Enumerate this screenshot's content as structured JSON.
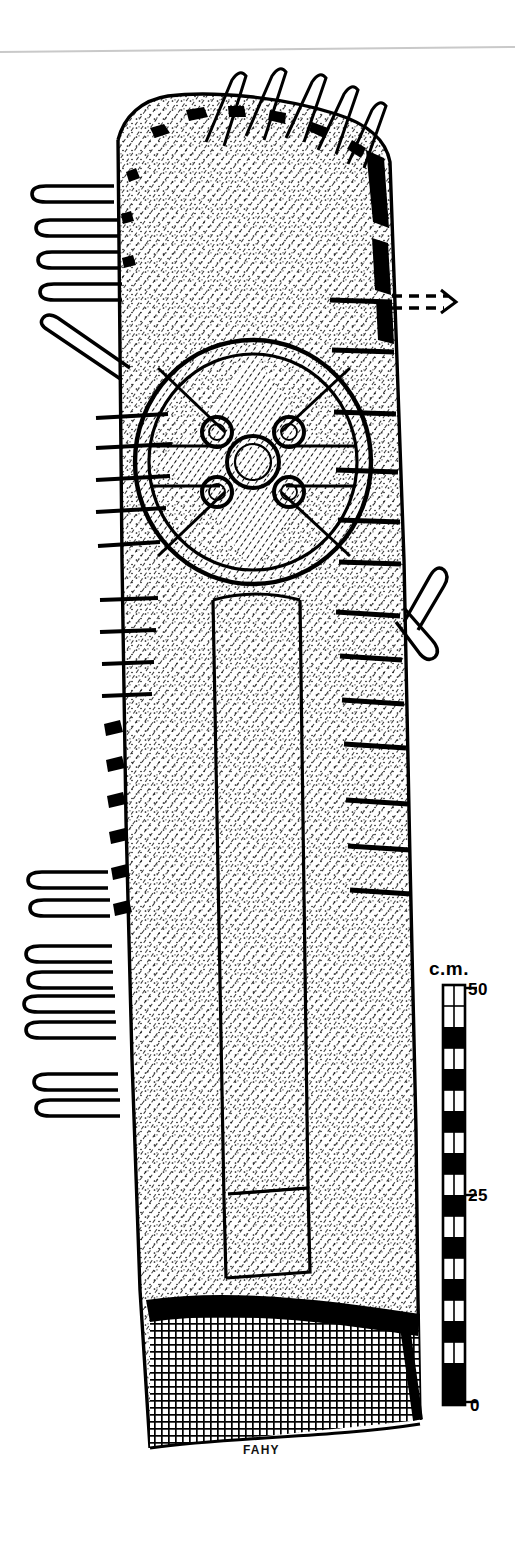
{
  "figure": {
    "technique": "ink line drawing, hatched and stippled",
    "signature": "FAHY",
    "background_color": "#ffffff",
    "ink_color": "#000000"
  },
  "scan": {
    "edge_line_visible": true,
    "edge_line_color": "#c8c8c8"
  },
  "scale_bar": {
    "unit_label": "c.m.",
    "ticks": [
      {
        "value": "50",
        "position": "top"
      },
      {
        "value": "25",
        "position": "middle"
      },
      {
        "value": "0",
        "position": "bottom"
      }
    ],
    "segment_count": 20,
    "orientation": "vertical",
    "fill_alternating": [
      "white",
      "black"
    ]
  },
  "slab": {
    "outline_note": "tall tapering slab, rounded damaged top, wider at base",
    "surface_fill": "diagonal hatching with stipple",
    "buried_base_fill": "dense cross-hatching",
    "ground_line": "solid black curved band"
  },
  "cross": {
    "type": "ringed cross / wheel cross",
    "ring": "double incised circle",
    "center_boss": {
      "label": "central boss",
      "count": 1
    },
    "arm_bosses": {
      "label": "arm junction bosses",
      "count": 4
    },
    "shaft": {
      "label": "double-line shaft",
      "lines": 2,
      "terminal": "stepped offset base"
    }
  },
  "annotations": {
    "loop_marks_note": "hairpin loop leader marks indicating breaks and edge damage",
    "top_loops": 5,
    "upper_left_loops": 4,
    "left_diagonal_loops": 1,
    "lower_left_loops": 7,
    "right_crossed_loops": 2,
    "dashed_arrow": {
      "label": "dashed leader arrow",
      "direction": "right"
    }
  }
}
